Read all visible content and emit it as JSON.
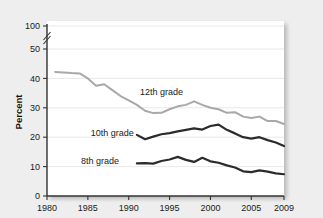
{
  "chart_data": {
    "type": "line",
    "title": "",
    "xlabel": "",
    "ylabel": "Percent",
    "xlim": [
      1980,
      2009
    ],
    "ylim": [
      0,
      100
    ],
    "y_axis_break": {
      "between": [
        50,
        100
      ],
      "note": "axis break between 50 and 100"
    },
    "grid": true,
    "grid_axis": "y",
    "legend": "inline-labels",
    "xticks": [
      1980,
      1985,
      1990,
      1995,
      2000,
      2005,
      2009
    ],
    "xtick_labels": [
      "1980",
      "1985",
      "1990",
      "1995",
      "2000",
      "2005",
      "2009"
    ],
    "yticks": [
      0,
      10,
      20,
      30,
      40,
      50,
      100
    ],
    "ytick_labels": [
      "0",
      "10",
      "20",
      "30",
      "40",
      "50",
      "100"
    ],
    "series": [
      {
        "name": "12th grade",
        "color": "#a8a8a8",
        "width": 2.0,
        "label_x": 1994.0,
        "label_y": 35.5,
        "x": [
          1981,
          1982,
          1983,
          1984,
          1985,
          1986,
          1987,
          1988,
          1989,
          1990,
          1991,
          1992,
          1993,
          1994,
          1995,
          1996,
          1997,
          1998,
          1999,
          2000,
          2001,
          2002,
          2003,
          2004,
          2005,
          2006,
          2007,
          2008,
          2009
        ],
        "values": [
          42.2,
          42.0,
          41.8,
          41.7,
          40.0,
          37.5,
          38.0,
          36.0,
          34.0,
          32.5,
          31.0,
          29.0,
          28.2,
          28.3,
          29.5,
          30.5,
          31.0,
          32.2,
          31.0,
          30.0,
          29.5,
          28.3,
          28.5,
          27.0,
          26.5,
          27.0,
          25.5,
          25.5,
          24.5
        ]
      },
      {
        "name": "10th grade",
        "color": "#2b2b2b",
        "width": 2.2,
        "label_x": 1988.0,
        "label_y": 21.5,
        "x": [
          1991,
          1992,
          1993,
          1994,
          1995,
          1996,
          1997,
          1998,
          1999,
          2000,
          2001,
          2002,
          2003,
          2004,
          2005,
          2006,
          2007,
          2008,
          2009
        ],
        "values": [
          20.8,
          19.3,
          20.2,
          21.0,
          21.4,
          22.0,
          22.5,
          23.0,
          22.6,
          23.8,
          24.3,
          22.5,
          21.3,
          20.0,
          19.5,
          20.0,
          19.0,
          18.2,
          17.0
        ]
      },
      {
        "name": "8th grade",
        "color": "#2b2b2b",
        "width": 2.2,
        "label_x": 1986.5,
        "label_y": 11.8,
        "x": [
          1991,
          1992,
          1993,
          1994,
          1995,
          1996,
          1997,
          1998,
          1999,
          2000,
          2001,
          2002,
          2003,
          2004,
          2005,
          2006,
          2007,
          2008,
          2009
        ],
        "values": [
          11.1,
          11.2,
          11.0,
          11.9,
          12.4,
          13.3,
          12.3,
          11.6,
          13.0,
          11.8,
          11.3,
          10.4,
          9.7,
          8.4,
          8.1,
          8.7,
          8.3,
          7.7,
          7.4
        ]
      }
    ]
  }
}
